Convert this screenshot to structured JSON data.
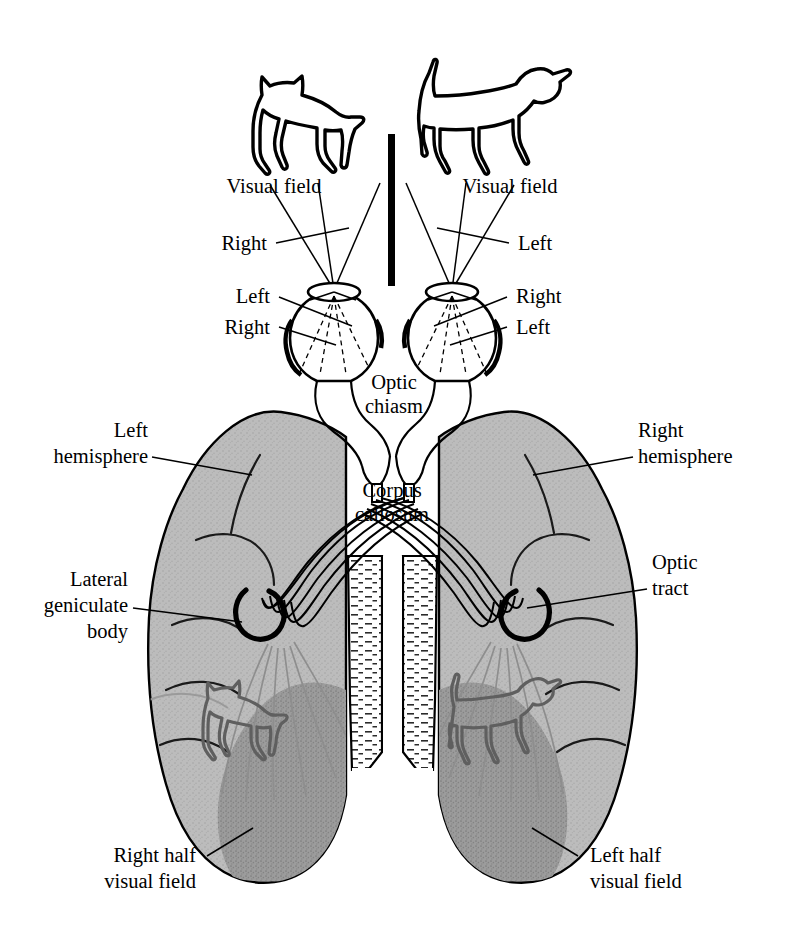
{
  "figure": {
    "subject_left": "cat-silhouette",
    "subject_right": "dog-silhouette",
    "divider": "vertical-black-bar"
  },
  "colors": {
    "ink": "#000000",
    "background": "#ffffff",
    "cortex_light": "#b9b9b9",
    "cortex_dark": "#9a9a9a",
    "cortex_outline": "#000000",
    "animal_outline_in_brain": "#5f5f5f",
    "radiation_lines": "#8a8a8a"
  },
  "labels": {
    "visual_field_left": "Visual field",
    "visual_field_right": "Visual field",
    "left_eye_upper": "Right",
    "right_eye_upper": "Left",
    "left_eye_mid": "Left",
    "left_eye_lower": "Right",
    "right_eye_mid": "Right",
    "right_eye_lower": "Left",
    "optic_chiasm_line1": "Optic",
    "optic_chiasm_line2": "chiasm",
    "corpus_callosum_line1": "Corpus",
    "corpus_callosum_line2": "callosum",
    "left_hemisphere_line1": "Left",
    "left_hemisphere_line2": "hemisphere",
    "right_hemisphere_line1": "Right",
    "right_hemisphere_line2": "hemisphere",
    "lateral_geniculate_line1": "Lateral",
    "lateral_geniculate_line2": "geniculate",
    "lateral_geniculate_line3": "body",
    "optic_tract_line1": "Optic",
    "optic_tract_line2": "tract",
    "right_half_vf_line1": "Right half",
    "right_half_vf_line2": "visual field",
    "left_half_vf_line1": "Left half",
    "left_half_vf_line2": "visual field"
  }
}
